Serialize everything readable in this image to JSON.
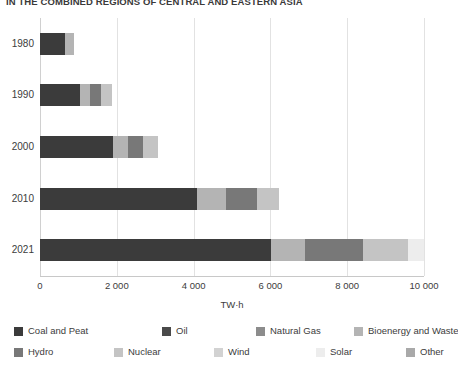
{
  "chart_data": {
    "type": "bar",
    "orientation": "horizontal",
    "stacked": true,
    "title": "IN THE COMBINED REGIONS OF CENTRAL AND EASTERN ASIA",
    "xlabel": "TW·h",
    "ylabel": "",
    "xlim": [
      0,
      10000
    ],
    "xticks": [
      0,
      2000,
      4000,
      6000,
      8000,
      10000
    ],
    "xticklabels": [
      "0",
      "2 000",
      "4 000",
      "6 000",
      "8 000",
      "10 000"
    ],
    "grid": true,
    "grid_axis": "x",
    "legend_position": "bottom",
    "categories": [
      "1980",
      "1990",
      "2000",
      "2010",
      "2021"
    ],
    "series": [
      {
        "name": "Coal and Peat",
        "color": "#3b3b3b",
        "values": [
          640,
          1050,
          1900,
          4080,
          6010
        ]
      },
      {
        "name": "Oil",
        "color": "#4a4a4a",
        "values": [
          0,
          0,
          0,
          0,
          0
        ]
      },
      {
        "name": "Natural Gas",
        "color": "#8c8c8c",
        "values": [
          0,
          0,
          0,
          0,
          0
        ]
      },
      {
        "name": "Bioenergy and Waste",
        "color": "#b4b4b4",
        "values": [
          250,
          250,
          390,
          760,
          890
        ]
      },
      {
        "name": "Hydro",
        "color": "#787878",
        "values": [
          0,
          300,
          400,
          800,
          1510
        ]
      },
      {
        "name": "Nuclear",
        "color": "#c4c4c4",
        "values": [
          0,
          270,
          390,
          580,
          1180
        ]
      },
      {
        "name": "Wind",
        "color": "#d2d2d2",
        "values": [
          0,
          0,
          0,
          0,
          0
        ]
      },
      {
        "name": "Solar",
        "color": "#ededed",
        "values": [
          0,
          0,
          0,
          0,
          420
        ]
      },
      {
        "name": "Other",
        "color": "#a9a9a9",
        "values": [
          0,
          0,
          0,
          0,
          0
        ]
      }
    ],
    "bar_stacks": [
      {
        "category": "1980",
        "segments": [
          {
            "name": "Coal and Peat",
            "color": "#3b3b3b",
            "value": 640
          },
          {
            "name": "Bioenergy and Waste",
            "color": "#b4b4b4",
            "value": 250
          }
        ]
      },
      {
        "category": "1990",
        "segments": [
          {
            "name": "Coal and Peat",
            "color": "#3b3b3b",
            "value": 1050
          },
          {
            "name": "Bioenergy and Waste",
            "color": "#b4b4b4",
            "value": 250
          },
          {
            "name": "Hydro",
            "color": "#787878",
            "value": 300
          },
          {
            "name": "Nuclear",
            "color": "#c4c4c4",
            "value": 270
          }
        ]
      },
      {
        "category": "2000",
        "segments": [
          {
            "name": "Coal and Peat",
            "color": "#3b3b3b",
            "value": 1900
          },
          {
            "name": "Bioenergy and Waste",
            "color": "#b4b4b4",
            "value": 390
          },
          {
            "name": "Hydro",
            "color": "#787878",
            "value": 400
          },
          {
            "name": "Nuclear",
            "color": "#c4c4c4",
            "value": 390
          }
        ]
      },
      {
        "category": "2010",
        "segments": [
          {
            "name": "Coal and Peat",
            "color": "#3b3b3b",
            "value": 4080
          },
          {
            "name": "Bioenergy and Waste",
            "color": "#b4b4b4",
            "value": 760
          },
          {
            "name": "Hydro",
            "color": "#787878",
            "value": 800
          },
          {
            "name": "Nuclear",
            "color": "#c4c4c4",
            "value": 580
          }
        ]
      },
      {
        "category": "2021",
        "segments": [
          {
            "name": "Coal and Peat",
            "color": "#3b3b3b",
            "value": 6010
          },
          {
            "name": "Bioenergy and Waste",
            "color": "#b4b4b4",
            "value": 890
          },
          {
            "name": "Hydro",
            "color": "#787878",
            "value": 1510
          },
          {
            "name": "Nuclear",
            "color": "#c4c4c4",
            "value": 1180
          },
          {
            "name": "Solar",
            "color": "#ededed",
            "value": 420
          }
        ]
      }
    ]
  },
  "legend": {
    "items": [
      {
        "label": "Coal and Peat",
        "color": "#3b3b3b"
      },
      {
        "label": "Oil",
        "color": "#4a4a4a"
      },
      {
        "label": "Natural Gas",
        "color": "#8c8c8c"
      },
      {
        "label": "Bioenergy and Waste",
        "color": "#b4b4b4"
      },
      {
        "label": "Hydro",
        "color": "#787878"
      },
      {
        "label": "Nuclear",
        "color": "#c4c4c4"
      },
      {
        "label": "Wind",
        "color": "#d2d2d2"
      },
      {
        "label": "Solar",
        "color": "#ededed"
      },
      {
        "label": "Other",
        "color": "#a9a9a9"
      }
    ]
  }
}
